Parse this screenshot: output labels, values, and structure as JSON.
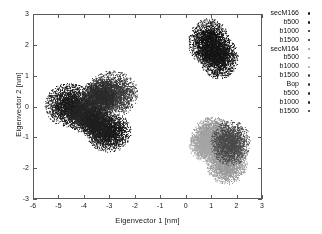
{
  "chart_data": {
    "type": "scatter",
    "title": "",
    "xlabel": "Eigenvector 1 [nm]",
    "ylabel": "Eigenvector 2 [nm]",
    "xlim": [
      -6,
      3
    ],
    "ylim": [
      -3,
      3
    ],
    "xticks": [
      "-6",
      "-5",
      "-4",
      "-3",
      "-2",
      "-1",
      "0",
      "1",
      "2",
      "3"
    ],
    "xtick_values": [
      -6,
      -5,
      -4,
      -3,
      -2,
      -1,
      0,
      1,
      2,
      3
    ],
    "yticks": [
      "-3",
      "-2",
      "-1",
      "0",
      "1",
      "2",
      "3"
    ],
    "ytick_values": [
      -3,
      -2,
      -1,
      0,
      1,
      2,
      3
    ],
    "grid": false,
    "legend_position": "outside-right",
    "background": "#ffffff",
    "axis_color": "#5a5a5a",
    "series": [
      {
        "name": "secM166",
        "color": "#1a1a1a",
        "marker": "dot",
        "center": [
          -4.6,
          0.05
        ],
        "radius_x": 0.62,
        "radius_y": 0.46,
        "n_points": 2600
      },
      {
        "name": "b500",
        "color": "#1a1a1a",
        "marker": "dot",
        "center": [
          -3.05,
          -0.82
        ],
        "radius_x": 0.56,
        "radius_y": 0.42,
        "n_points": 2300
      },
      {
        "name": "b1000",
        "color": "#121212",
        "marker": "dot",
        "center": [
          0.92,
          2.12
        ],
        "radius_x": 0.52,
        "radius_y": 0.49,
        "n_points": 2300
      },
      {
        "name": "b1500",
        "color": "#151515",
        "marker": "dot",
        "center": [
          1.32,
          1.62
        ],
        "radius_x": 0.48,
        "radius_y": 0.45,
        "n_points": 2100
      },
      {
        "name": "secM164",
        "color": "#8f8f8f",
        "marker": "dot",
        "center": [
          1.12,
          -1.02
        ],
        "radius_x": 0.58,
        "radius_y": 0.44,
        "n_points": 2400
      },
      {
        "name": "b500",
        "color": "#9a9a9a",
        "marker": "dot",
        "center": [
          1.62,
          -1.88
        ],
        "radius_x": 0.52,
        "radius_y": 0.42,
        "n_points": 2200
      },
      {
        "name": "b1000",
        "color": "#a5a5a5",
        "marker": "dot",
        "center": [
          0.82,
          -1.22
        ],
        "radius_x": 0.44,
        "radius_y": 0.38,
        "n_points": 1800
      },
      {
        "name": "b1500",
        "color": "#4a4a4a",
        "marker": "dot",
        "center": [
          1.78,
          -1.18
        ],
        "radius_x": 0.5,
        "radius_y": 0.47,
        "n_points": 2200
      },
      {
        "name": "Bop",
        "color": "#3c3c3c",
        "marker": "dot",
        "center": [
          -2.92,
          0.42
        ],
        "radius_x": 0.66,
        "radius_y": 0.48,
        "n_points": 2700
      },
      {
        "name": "b500",
        "color": "#2b2b2b",
        "marker": "dot",
        "center": [
          -3.45,
          0.3
        ],
        "radius_x": 0.46,
        "radius_y": 0.38,
        "n_points": 1700
      },
      {
        "name": "b1000",
        "color": "#252525",
        "marker": "dot",
        "center": [
          -4.05,
          -0.28
        ],
        "radius_x": 0.42,
        "radius_y": 0.36,
        "n_points": 1600
      },
      {
        "name": "b1500",
        "color": "#1f1f1f",
        "marker": "dot",
        "center": [
          -3.55,
          -0.55
        ],
        "radius_x": 0.4,
        "radius_y": 0.34,
        "n_points": 1500
      }
    ]
  },
  "legend": {
    "entries": [
      {
        "label": "secM166",
        "color": "#1a1a1a"
      },
      {
        "label": "b500",
        "color": "#1a1a1a"
      },
      {
        "label": "b1000",
        "color": "#121212"
      },
      {
        "label": "b1500",
        "color": "#151515"
      },
      {
        "label": "secM164",
        "color": "#8f8f8f"
      },
      {
        "label": "b500",
        "color": "#9a9a9a"
      },
      {
        "label": "b1000",
        "color": "#a5a5a5"
      },
      {
        "label": "b1500",
        "color": "#4a4a4a"
      },
      {
        "label": "Bop",
        "color": "#3c3c3c"
      },
      {
        "label": "b500",
        "color": "#2b2b2b"
      },
      {
        "label": "b1000",
        "color": "#252525"
      },
      {
        "label": "b1500",
        "color": "#1f1f1f"
      }
    ]
  }
}
